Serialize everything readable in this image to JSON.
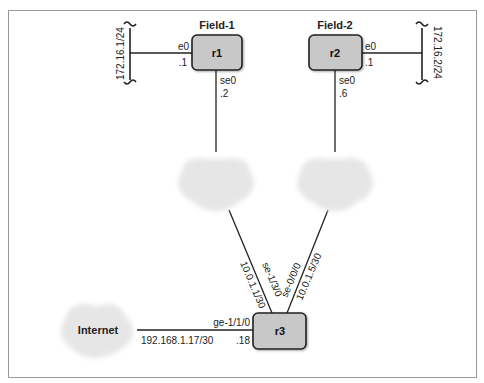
{
  "diagram": {
    "frame_color": "#9a9a9a",
    "router_fill": "#c8c8c8",
    "router_stroke": "#222222",
    "cloud_fill": "#e6e6e6",
    "routers": [
      {
        "id": "r1",
        "label": "r1",
        "group_title": "Field-1"
      },
      {
        "id": "r2",
        "label": "r2",
        "group_title": "Field-2"
      },
      {
        "id": "r3",
        "label": "r3"
      }
    ],
    "clouds": [
      {
        "id": "cloud-1",
        "label": ""
      },
      {
        "id": "cloud-2",
        "label": ""
      },
      {
        "id": "internet",
        "label": "Internet"
      }
    ],
    "lans": [
      {
        "id": "lan-left",
        "subnet": "172.16.1/24"
      },
      {
        "id": "lan-right",
        "subnet": "172.16.2/24"
      }
    ],
    "interfaces": {
      "r1_e0": {
        "name": "e0",
        "addr": ".1"
      },
      "r1_se0": {
        "name": "se0",
        "addr": ".2"
      },
      "r2_e0": {
        "name": "e0",
        "addr": ".1"
      },
      "r2_se0": {
        "name": "se0",
        "addr": ".6"
      },
      "r3_left_serial": {
        "name": "se-1/3/0",
        "addr": "10.0.1.1/30"
      },
      "r3_right_serial": {
        "name": "se-0/0/0",
        "addr": "10.0.1.5/30"
      },
      "r3_ge": {
        "name": "ge-1/1/0",
        "addr": ".18"
      },
      "internet_link": {
        "subnet": "192.168.1.17/30"
      }
    }
  }
}
